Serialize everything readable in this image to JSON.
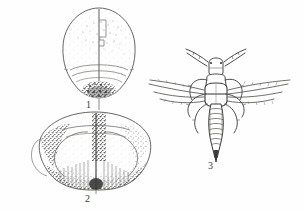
{
  "plate": {
    "kind": "entomological-illustration-plate",
    "background_color": "#fefefe",
    "ink_color": "#4a4a48",
    "dark_ink_color": "#2e2e2c",
    "width": 305,
    "height": 213,
    "figure_count": 3
  },
  "figures": [
    {
      "number": "1",
      "label": "1",
      "name": "head-dorsal-view",
      "description": "Rounded head capsule in dorsal view with a vertical midline suture, faint stippling on the disc and a dark stippled patch at the posterior margin.",
      "label_x": 86,
      "label_y": 100,
      "bounds": {
        "x": 62,
        "y": 8,
        "width": 74,
        "height": 92
      }
    },
    {
      "number": "2",
      "label": "2",
      "name": "pronotum-dorsal-view",
      "description": "Broad elliptical pronotum in dorsal view with a vertical midline, inner arched ridges and heavy dark stippling along the lateral and posterior margins.",
      "label_x": 85,
      "label_y": 194,
      "bounds": {
        "x": 40,
        "y": 112,
        "width": 110,
        "height": 78
      }
    },
    {
      "number": "3",
      "label": "3",
      "name": "adult-winged-insect-dorsal-view",
      "description": "Whole adult thrips-like insect in dorsal view: two segmented antennae, head, thorax, four narrow fringed wings, six legs and a segmented tapering abdomen.",
      "label_x": 208,
      "label_y": 161,
      "bounds": {
        "x": 148,
        "y": 48,
        "width": 144,
        "height": 112
      },
      "parts": [
        "antenna-left",
        "antenna-right",
        "head",
        "thorax",
        "forewing-left",
        "forewing-right",
        "hindwing-left",
        "hindwing-right",
        "leg-fore-left",
        "leg-fore-right",
        "leg-mid-left",
        "leg-mid-right",
        "leg-hind-left",
        "leg-hind-right",
        "abdomen",
        "abdomen-tip"
      ]
    }
  ]
}
